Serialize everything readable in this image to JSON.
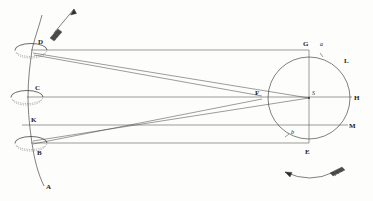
{
  "figure": {
    "background_color": "#fdfdfc",
    "ink_color": "#2b2b2b",
    "width": 373,
    "height": 201
  },
  "labels": {
    "aperture_top": "D",
    "aperture_middle": "C",
    "aperture_bottom": "B",
    "axis_lower_end": "A",
    "line_k": "K",
    "circle_top": "G",
    "circle_top_right_small": "a",
    "circle_arc_right_upper": "L",
    "circle_center": "S",
    "circle_right": "H",
    "circle_right_lower": "M",
    "circle_bottom": "E",
    "circle_bottom_left_small": "b",
    "convergence_point": "F"
  },
  "icons": {
    "motion_arrow_top": "up-arrow-icon",
    "rotation_arrow_bottom": "curved-rotation-arrow-icon"
  },
  "geometry": {
    "ellipse_top": {
      "cx": 31,
      "cy": 50,
      "rx": 16,
      "ry": 6
    },
    "ellipse_middle": {
      "cx": 27,
      "cy": 97,
      "rx": 16,
      "ry": 6
    },
    "ellipse_bottom": {
      "cx": 31,
      "cy": 143,
      "rx": 16,
      "ry": 6
    },
    "circle_main": {
      "cx": 309,
      "cy": 98,
      "r": 41
    },
    "point_F": {
      "x": 262,
      "y": 96
    },
    "point_S": {
      "x": 309,
      "y": 98
    },
    "axis_line": {
      "x1": 41,
      "y1": 15,
      "x2": 42,
      "y2": 186
    }
  }
}
